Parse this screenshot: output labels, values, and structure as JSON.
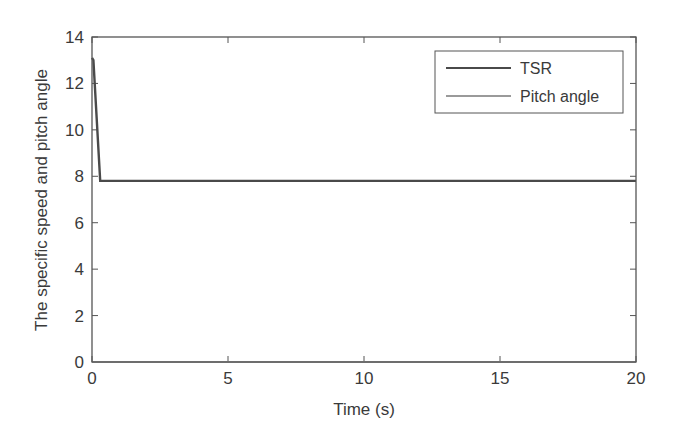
{
  "chart_data": {
    "type": "line",
    "title": "",
    "xlabel": "Time (s)",
    "ylabel": "The specific speed and pitch angle",
    "xlim": [
      0,
      20
    ],
    "ylim": [
      0,
      14
    ],
    "xticks": [
      0,
      5,
      10,
      15,
      20
    ],
    "yticks": [
      0,
      2,
      4,
      6,
      8,
      10,
      12,
      14
    ],
    "grid": false,
    "legend_position": "upper right",
    "series": [
      {
        "name": "TSR",
        "color": "#4a4a4a",
        "x": [
          0,
          0.05,
          0.3,
          1,
          5,
          10,
          15,
          20
        ],
        "y": [
          13.1,
          13.0,
          7.8,
          7.8,
          7.8,
          7.8,
          7.8,
          7.8
        ]
      },
      {
        "name": "Pitch angle",
        "color": "#9a9a9a",
        "x": [
          0,
          5,
          10,
          15,
          20
        ],
        "y": [
          0,
          0,
          0,
          0,
          0
        ]
      }
    ]
  },
  "legend": {
    "items": [
      {
        "label": "TSR"
      },
      {
        "label": "Pitch angle"
      }
    ]
  }
}
